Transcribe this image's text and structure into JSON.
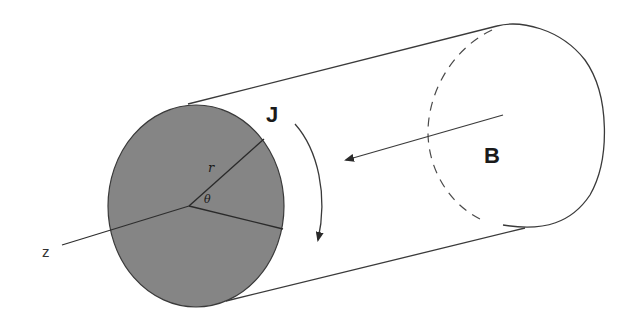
{
  "diagram": {
    "type": "cylinder-cross-section",
    "labels": {
      "current_density": "J",
      "magnetic_field": "B",
      "radius": "r",
      "angle": "θ",
      "axis": "z"
    },
    "colors": {
      "face_fill": "#858585",
      "stroke": "#3a3a3a",
      "background": "#ffffff"
    }
  }
}
